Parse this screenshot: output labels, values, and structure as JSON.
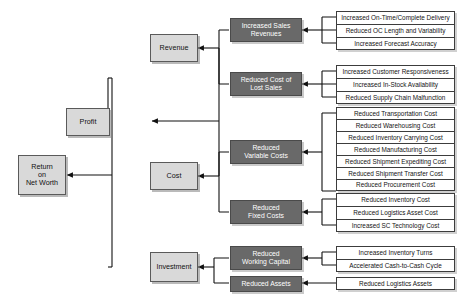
{
  "diagram": {
    "colors": {
      "light_box_fill": "#d9d9d9",
      "dark_box_fill": "#696969",
      "leaf_box_fill": "#ffffff",
      "border": "#3c3c3c",
      "connector": "#111111",
      "background": "#ffffff"
    },
    "root": {
      "label": "Return\non Net Worth",
      "line1": "Return",
      "line2": "on",
      "line3": "Net Worth"
    },
    "level1": [
      {
        "label": "Profit"
      },
      {
        "label": "Investment"
      }
    ],
    "level2": [
      {
        "label": "Revenue"
      },
      {
        "label": "Cost"
      }
    ],
    "level3": [
      {
        "label": "Increased Sales Revenues",
        "line1": "Increased Sales",
        "line2": "Revenues"
      },
      {
        "label": "Reduced Cost of Lost Sales",
        "line1": "Reduced Cost of",
        "line2": "Lost Sales"
      },
      {
        "label": "Reduced Variable Costs",
        "line1": "Reduced",
        "line2": "Variable Costs"
      },
      {
        "label": "Reduced Fixed Costs",
        "line1": "Reduced",
        "line2": "Fixed Costs"
      },
      {
        "label": "Reduced Working Capital",
        "line1": "Reduced",
        "line2": "Working Capital"
      },
      {
        "label": "Reduced Assets",
        "line1": "Reduced Assets",
        "line2": ""
      }
    ],
    "groups": {
      "increased_sales_revenues": [
        "Increased On-Time/Complete Delivery",
        "Reduced OC Length and Variability",
        "Increased Forecast Accuracy"
      ],
      "reduced_cost_of_lost_sales": [
        "Increased Customer Responsiveness",
        "Increased In-Stock Availability",
        "Reduced Supply Chain Malfunction"
      ],
      "reduced_variable_costs": [
        "Reduced Transportation Cost",
        "Reduced Warehousing Cost",
        "Reduced Inventory Carrying Cost",
        "Reduced Manufacturing Cost",
        "Reduced Shipment Expediting Cost",
        "Reduced Shipment Transfer Cost",
        "Reduced Procurement Cost"
      ],
      "reduced_fixed_costs": [
        "Reduced Inventory Cost",
        "Reduced Logistics Asset Cost",
        "Increased SC Technology Cost"
      ],
      "reduced_working_capital": [
        "Increased Inventory Turns",
        "Accelerated Cash-to-Cash Cycle"
      ],
      "reduced_assets": [
        "Reduced Logistics Assets"
      ]
    }
  }
}
